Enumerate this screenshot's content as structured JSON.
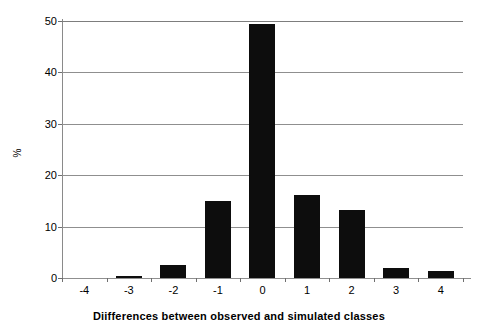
{
  "chart_data": {
    "type": "bar",
    "title": "",
    "xlabel": "Diifferences between observed and simulated classes",
    "ylabel": "%",
    "categories": [
      "-4",
      "-3",
      "-2",
      "-1",
      "0",
      "1",
      "2",
      "3",
      "4"
    ],
    "values": [
      0,
      0.3,
      2.5,
      14.9,
      49.4,
      16.1,
      13.3,
      1.9,
      1.3
    ],
    "ylim": [
      0,
      50
    ],
    "yticks": [
      0,
      10,
      20,
      30,
      40,
      50
    ],
    "ytick_labels": [
      "0",
      "10",
      "20",
      "30",
      "40",
      "50"
    ],
    "grid": "horizontal",
    "legend": "none",
    "bar_color": "#0d0d0d",
    "gridline_color": "#8f8f8f",
    "axis_color": "#8a8a8a",
    "background_color": "#ffffff"
  }
}
